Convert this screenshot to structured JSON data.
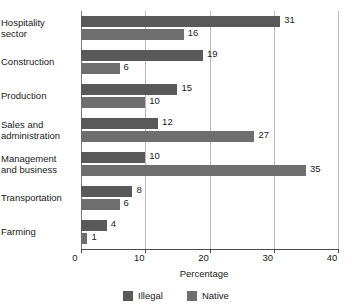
{
  "chart_data": {
    "type": "bar",
    "orientation": "horizontal",
    "title": "",
    "xlabel": "Percentage",
    "ylabel": "",
    "xlim": [
      0,
      40
    ],
    "xticks": [
      0,
      10,
      20,
      30,
      40
    ],
    "xtick_labels": [
      "0",
      "10",
      "20",
      "30",
      "40"
    ],
    "grid": true,
    "grid_axis": "x",
    "legend_position": "bottom",
    "categories": [
      "Hospitality sector",
      "Construction",
      "Production",
      "Sales and administration",
      "Management and business",
      "Transportation",
      "Farming"
    ],
    "category_lines": [
      [
        "Hospitality",
        "sector"
      ],
      [
        "Construction"
      ],
      [
        "Production"
      ],
      [
        "Sales and",
        "administration"
      ],
      [
        "Management",
        "and business"
      ],
      [
        "Transportation"
      ],
      [
        "Farming"
      ]
    ],
    "series": [
      {
        "name": "Illegal",
        "color": "#595959",
        "values": [
          31,
          19,
          15,
          12,
          10,
          8,
          4
        ],
        "value_labels": [
          "31",
          "19",
          "15",
          "12",
          "10",
          "8",
          "4"
        ]
      },
      {
        "name": "Native",
        "color": "#6e6e6e",
        "values": [
          16,
          6,
          10,
          27,
          35,
          6,
          1
        ],
        "value_labels": [
          "16",
          "6",
          "10",
          "27",
          "35",
          "6",
          "1"
        ]
      }
    ]
  },
  "legend": {
    "items": [
      {
        "label": "Illegal",
        "color": "#595959"
      },
      {
        "label": "Native",
        "color": "#6e6e6e"
      }
    ]
  },
  "axis": {
    "x_title": "Percentage"
  },
  "colors": {
    "background": "#ffffff",
    "text": "#1a1a1a",
    "gridline": "#b8b8b8",
    "axis": "#4a4a4a"
  }
}
